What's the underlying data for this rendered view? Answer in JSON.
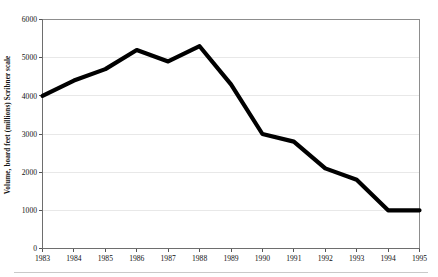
{
  "chart_data": {
    "type": "line",
    "title": "",
    "subtitle": "",
    "xlabel": "",
    "ylabel": "Volume, board feet (millions) Scribner scale",
    "categories": [
      "1983",
      "1984",
      "1985",
      "1986",
      "1987",
      "1988",
      "1989",
      "1990",
      "1991",
      "1992",
      "1993",
      "1994",
      "1995"
    ],
    "x": [
      1983,
      1984,
      1985,
      1986,
      1987,
      1988,
      1989,
      1990,
      1991,
      1992,
      1993,
      1994,
      1995
    ],
    "values": [
      4000,
      4400,
      4700,
      5200,
      4900,
      5300,
      4300,
      3000,
      2800,
      2100,
      1800,
      1000,
      1000
    ],
    "series": [
      {
        "name": "Timber harvest volume",
        "values": [
          4000,
          4400,
          4700,
          5200,
          4900,
          5300,
          4300,
          3000,
          2800,
          2100,
          1800,
          1000,
          1000
        ]
      }
    ],
    "ylim": [
      0,
      6000
    ],
    "xlim": [
      1983,
      1995
    ],
    "ytick_labels": [
      "0",
      "1000",
      "2000",
      "3000",
      "4000",
      "5000",
      "6000"
    ],
    "ytick_values": [
      0,
      1000,
      2000,
      3000,
      4000,
      5000,
      6000
    ],
    "xtick_labels": [
      "1983",
      "1984",
      "1985",
      "1986",
      "1987",
      "1988",
      "1989",
      "1990",
      "1991",
      "1992",
      "1993",
      "1994",
      "1995"
    ],
    "grid": true,
    "grid_axis": "y",
    "legend": false,
    "legend_position": "none",
    "line_color": "#000000",
    "grid_color": "#e2e2e2",
    "axis_color": "#6e6e6e",
    "background_color": "#ffffff",
    "annotations": []
  }
}
